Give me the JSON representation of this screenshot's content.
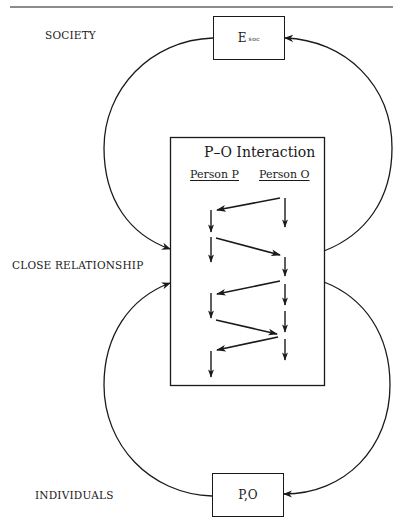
{
  "levels": {
    "society": "SOCIETY",
    "close_relationship": "CLOSE RELATIONSHIP",
    "individuals": "INDIVIDUALS"
  },
  "boxes": {
    "society_env": {
      "main": "E",
      "subscript": "soc"
    },
    "interaction": {
      "title": "P–O Interaction",
      "columns": [
        "Person P",
        "Person O"
      ]
    },
    "individuals": {
      "label": "P,O"
    }
  },
  "interaction_sequence": {
    "person_p_arrows": 5,
    "person_o_arrows": 6,
    "cross_arrows": [
      {
        "from": "Person O",
        "to": "Person P"
      },
      {
        "from": "Person P",
        "to": "Person O"
      },
      {
        "from": "Person O",
        "to": "Person P"
      },
      {
        "from": "Person P",
        "to": "Person O"
      },
      {
        "from": "Person O",
        "to": "Person P"
      }
    ]
  },
  "feedback_loops": [
    {
      "from": "Close Relationship",
      "to": "Society",
      "side": "right"
    },
    {
      "from": "Society",
      "to": "Close Relationship",
      "side": "left"
    },
    {
      "from": "Individuals",
      "to": "Close Relationship",
      "side": "left"
    },
    {
      "from": "Close Relationship",
      "to": "Individuals",
      "side": "right"
    }
  ]
}
